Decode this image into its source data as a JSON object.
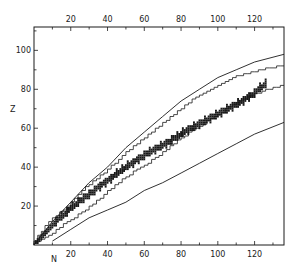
{
  "chart_data": {
    "type": "scatter",
    "title": "",
    "xlabel": "N",
    "ylabel": "Z",
    "xlim": [
      0,
      136
    ],
    "ylim": [
      0,
      112
    ],
    "grid": false,
    "legend": null,
    "x_ticks_bottom": [
      20,
      40,
      60,
      80,
      100,
      120
    ],
    "x_ticks_top": [
      20,
      40,
      60,
      80,
      100,
      120
    ],
    "y_ticks": [
      20,
      40,
      60,
      80,
      100
    ],
    "x_minor_step": 10,
    "y_minor_step": 10,
    "series": [
      {
        "name": "proton drip line",
        "style": "smooth-line",
        "points": [
          [
            0,
            0
          ],
          [
            10,
            12
          ],
          [
            20,
            22
          ],
          [
            30,
            32
          ],
          [
            40,
            40
          ],
          [
            50,
            50
          ],
          [
            60,
            58
          ],
          [
            70,
            66
          ],
          [
            80,
            74
          ],
          [
            90,
            80
          ],
          [
            100,
            86
          ],
          [
            110,
            90
          ],
          [
            120,
            94
          ],
          [
            136,
            98
          ]
        ]
      },
      {
        "name": "known nuclides upper boundary",
        "style": "stepped-line",
        "points": [
          [
            0,
            0
          ],
          [
            10,
            12
          ],
          [
            20,
            20
          ],
          [
            30,
            30
          ],
          [
            40,
            37
          ],
          [
            50,
            46
          ],
          [
            60,
            54
          ],
          [
            70,
            61
          ],
          [
            80,
            69
          ],
          [
            90,
            76
          ],
          [
            100,
            81
          ],
          [
            110,
            86
          ],
          [
            120,
            89
          ],
          [
            136,
            92
          ]
        ]
      },
      {
        "name": "stable nuclides",
        "style": "squares",
        "band_center": [
          [
            1,
            1
          ],
          [
            10,
            10
          ],
          [
            20,
            19
          ],
          [
            30,
            26
          ],
          [
            40,
            33
          ],
          [
            50,
            40
          ],
          [
            60,
            46
          ],
          [
            70,
            51
          ],
          [
            80,
            57
          ],
          [
            90,
            62
          ],
          [
            100,
            67
          ],
          [
            110,
            72
          ],
          [
            120,
            78
          ],
          [
            126,
            83
          ]
        ]
      },
      {
        "name": "known nuclides lower boundary",
        "style": "stepped-line",
        "points": [
          [
            0,
            0
          ],
          [
            10,
            5
          ],
          [
            20,
            12
          ],
          [
            30,
            18
          ],
          [
            40,
            26
          ],
          [
            50,
            34
          ],
          [
            60,
            40
          ],
          [
            70,
            46
          ],
          [
            80,
            54
          ],
          [
            90,
            60
          ],
          [
            100,
            66
          ],
          [
            110,
            72
          ],
          [
            120,
            77
          ],
          [
            136,
            82
          ]
        ]
      },
      {
        "name": "neutron drip line",
        "style": "smooth-line",
        "points": [
          [
            10,
            2
          ],
          [
            20,
            8
          ],
          [
            30,
            14
          ],
          [
            40,
            18
          ],
          [
            50,
            22
          ],
          [
            60,
            28
          ],
          [
            70,
            32
          ],
          [
            80,
            37
          ],
          [
            90,
            42
          ],
          [
            100,
            47
          ],
          [
            110,
            52
          ],
          [
            120,
            57
          ],
          [
            136,
            63
          ]
        ]
      }
    ]
  },
  "colors": {
    "ink": "#1a1a1a",
    "background": "#ffffff"
  }
}
